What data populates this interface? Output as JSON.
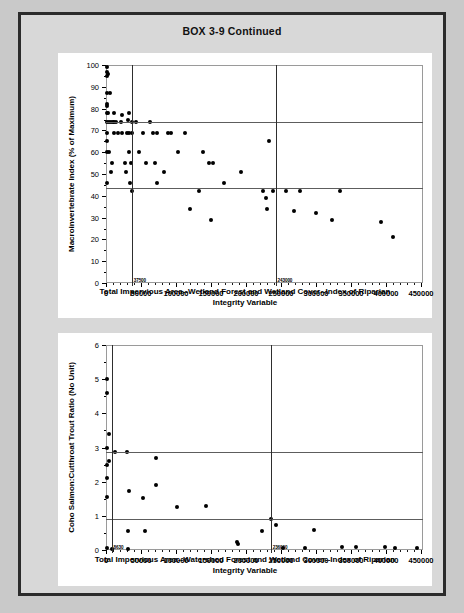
{
  "page": {
    "title": "BOX 3-9 Continued",
    "background_color": "#c9c9c9",
    "frame_color": "#d8d8d8",
    "border_color": "#2b2b2b"
  },
  "chart_data": [
    {
      "id": "macroinvertebrate-scatter",
      "type": "scatter",
      "title": "",
      "xlabel": "Total Impervious Area--Wetland Forest and Wetland Cover--Index of Riparian Integrity Variable",
      "xlabel_line1": "Total Impervious Area--Wetland Forest and Wetland Cover--Index of Riparian",
      "xlabel_line2": "Integrity Variable",
      "ylabel": "Macroinvertebrate Index (% of Maximum)",
      "xlim": [
        0,
        450000
      ],
      "ylim": [
        0,
        100
      ],
      "xticks": [
        0,
        50000,
        100000,
        150000,
        200000,
        250000,
        300000,
        350000,
        400000,
        450000
      ],
      "xticklabels": [
        "0",
        "50000",
        "100000",
        "150000",
        "200000",
        "250000",
        "300000",
        "350000",
        "400000",
        "450000"
      ],
      "yticks": [
        0,
        10,
        20,
        30,
        40,
        50,
        60,
        70,
        80,
        90,
        100
      ],
      "yticklabels": [
        "0",
        "10",
        "20",
        "30",
        "40",
        "50",
        "60",
        "70",
        "80",
        "90",
        "100"
      ],
      "grid": false,
      "legend": "none",
      "marker_color": "#000000",
      "reference_lines": {
        "vertical": [
          {
            "x": 37500,
            "label": "37500"
          },
          {
            "x": 243000,
            "label": "243000"
          }
        ],
        "horizontal": [
          {
            "y": 74
          },
          {
            "y": 43.5
          }
        ]
      },
      "points": [
        [
          1500,
          99
        ],
        [
          1500,
          97
        ],
        [
          2200,
          96
        ],
        [
          1500,
          95
        ],
        [
          1500,
          87
        ],
        [
          5500,
          87
        ],
        [
          1500,
          82
        ],
        [
          1500,
          81
        ],
        [
          1500,
          78
        ],
        [
          3500,
          78
        ],
        [
          11500,
          78
        ],
        [
          23500,
          77
        ],
        [
          33500,
          78
        ],
        [
          1500,
          74
        ],
        [
          4000,
          74
        ],
        [
          7500,
          74
        ],
        [
          9500,
          74
        ],
        [
          11500,
          74
        ],
        [
          14500,
          74
        ],
        [
          21500,
          74
        ],
        [
          31500,
          75
        ],
        [
          36500,
          74
        ],
        [
          43500,
          74
        ],
        [
          62500,
          74
        ],
        [
          1500,
          69
        ],
        [
          11500,
          69
        ],
        [
          16500,
          69
        ],
        [
          22500,
          69
        ],
        [
          30500,
          69
        ],
        [
          33500,
          69
        ],
        [
          37500,
          69
        ],
        [
          52500,
          69
        ],
        [
          66500,
          69
        ],
        [
          72500,
          69
        ],
        [
          88500,
          69
        ],
        [
          92500,
          69
        ],
        [
          112500,
          69
        ],
        [
          1500,
          65
        ],
        [
          1500,
          60
        ],
        [
          4500,
          60
        ],
        [
          33500,
          60
        ],
        [
          46500,
          60
        ],
        [
          102500,
          60
        ],
        [
          138500,
          60
        ],
        [
          8500,
          55
        ],
        [
          26500,
          55
        ],
        [
          35500,
          55
        ],
        [
          56500,
          55
        ],
        [
          70500,
          55
        ],
        [
          146500,
          55
        ],
        [
          152500,
          55
        ],
        [
          6500,
          51
        ],
        [
          28500,
          51
        ],
        [
          82500,
          51
        ],
        [
          192500,
          51
        ],
        [
          1500,
          46
        ],
        [
          34500,
          46
        ],
        [
          73500,
          46
        ],
        [
          168500,
          46
        ],
        [
          37500,
          42
        ],
        [
          132500,
          42
        ],
        [
          224500,
          42
        ],
        [
          238500,
          42
        ],
        [
          256500,
          42
        ],
        [
          276500,
          42
        ],
        [
          334500,
          42
        ],
        [
          232500,
          65
        ],
        [
          228500,
          39
        ],
        [
          230500,
          34
        ],
        [
          268500,
          33
        ],
        [
          300500,
          32
        ],
        [
          322500,
          29
        ],
        [
          392500,
          28
        ],
        [
          410500,
          21
        ],
        [
          119500,
          34
        ],
        [
          150500,
          29
        ]
      ]
    },
    {
      "id": "coho-cutthroat-scatter",
      "type": "scatter",
      "title": "",
      "xlabel": "Total Impervious Area--Watershed Forest and Wetland Cover--Index of Riparian Integrity Variable",
      "xlabel_line1": "Total Impervious Area--Watershed Forest and Wetland Cover--Index of Riparian",
      "xlabel_line2": "Integrity Variable",
      "ylabel": "Coho Salmon:Cutthroat Trout Ratio (No Unit)",
      "xlim": [
        0,
        450000
      ],
      "ylim": [
        0,
        6
      ],
      "xticks": [
        0,
        50000,
        100000,
        150000,
        200000,
        250000,
        300000,
        350000,
        400000,
        450000
      ],
      "xticklabels": [
        "0",
        "50000",
        "100000",
        "150000",
        "200000",
        "250000",
        "300000",
        "350000",
        "400000",
        "450000"
      ],
      "yticks": [
        0,
        1,
        2,
        3,
        4,
        5,
        6
      ],
      "yticklabels": [
        "0",
        "1",
        "2",
        "3",
        "4",
        "5",
        "6"
      ],
      "grid": false,
      "legend": "none",
      "marker_color": "#000000",
      "reference_lines": {
        "vertical": [
          {
            "x": 8630,
            "label": "8630"
          },
          {
            "x": 236000,
            "label": "236000"
          }
        ],
        "horizontal": [
          {
            "y": 2.88
          },
          {
            "y": 0.92
          }
        ]
      },
      "points": [
        [
          1200,
          5.0
        ],
        [
          1200,
          4.6
        ],
        [
          4800,
          3.4
        ],
        [
          1200,
          3.0
        ],
        [
          4800,
          2.6
        ],
        [
          1200,
          2.5
        ],
        [
          1200,
          2.1
        ],
        [
          1200,
          1.55
        ],
        [
          1200,
          0.05
        ],
        [
          8630,
          0.02
        ],
        [
          13500,
          2.88
        ],
        [
          30500,
          2.88
        ],
        [
          32500,
          1.72
        ],
        [
          31500,
          0.03
        ],
        [
          31500,
          0.55
        ],
        [
          53500,
          1.53
        ],
        [
          55500,
          0.55
        ],
        [
          71500,
          2.68
        ],
        [
          71500,
          1.9
        ],
        [
          101500,
          1.25
        ],
        [
          142500,
          1.3
        ],
        [
          186500,
          0.22
        ],
        [
          188500,
          0.18
        ],
        [
          222500,
          0.55
        ],
        [
          236000,
          0.92
        ],
        [
          243500,
          0.72
        ],
        [
          252500,
          0.05
        ],
        [
          284500,
          0.05
        ],
        [
          296500,
          0.6
        ],
        [
          336500,
          0.08
        ],
        [
          356500,
          0.1
        ],
        [
          398500,
          0.08
        ],
        [
          412500,
          0.06
        ],
        [
          444500,
          0.05
        ]
      ]
    }
  ]
}
